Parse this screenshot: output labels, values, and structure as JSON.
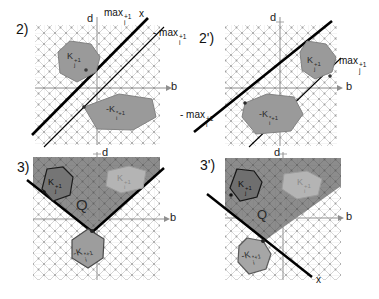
{
  "figure": {
    "description_labels": {
      "q": "Q",
      "x": "x"
    },
    "colors": {
      "background": "#ffffff",
      "hatch_line": "#c4c4c4",
      "hatch_dot": "#9e9e9e",
      "axis_gray": "#8f8f8f",
      "tangent_line_black": "#000000",
      "cone_region_gray": "#8c8c8c",
      "polygon_gray": "#9a9a9a",
      "polygon_dark_gray": "#757575",
      "polygon_light_gray": "#b4b4b4"
    },
    "panels": {
      "p2": {
        "number": "2)",
        "axis_d": "d",
        "axis_b": "b",
        "x_label": "x",
        "max_line": {
          "pre": "max",
          "sup": "+1",
          "sub": "i"
        },
        "neg_max_line": {
          "pre": "- max",
          "sup": "+1",
          "sub": "i"
        },
        "poly_upper": {
          "base": "K",
          "sup": "+1",
          "sub": "j"
        },
        "poly_lower": {
          "base": "-K",
          "sup": "*+1",
          "sub": "i"
        }
      },
      "p2p": {
        "number": "2')",
        "axis_d": "d",
        "axis_b": "b",
        "max_line": {
          "pre": "max",
          "sup": "+1",
          "sub": "j"
        },
        "neg_max_line": {
          "pre": "- max",
          "sup": "+1",
          "sub": "i"
        },
        "poly_upper": {
          "base": "K",
          "sup": "+1",
          "sub": "j"
        },
        "poly_lower": {
          "base": "-K",
          "sup": "*+1",
          "sub": "i"
        }
      },
      "p3": {
        "number": "3)",
        "axis_d": "d",
        "axis_b": "b",
        "q_label": "Q",
        "poly_left": {
          "base": "K",
          "sup": "+1",
          "sub": "j"
        },
        "poly_right": {
          "base": "K",
          "sup": "+1",
          "sub": "i"
        },
        "poly_bottom": {
          "base": "-K",
          "sup": "*+1",
          "sub": "i"
        }
      },
      "p3p": {
        "number": "3')",
        "axis_d": "d",
        "axis_b": "b",
        "q_label": "Q",
        "x_label": "x",
        "poly_left": {
          "base": "K",
          "sup": "+1",
          "sub": "j"
        },
        "poly_right": {
          "base": "K",
          "sup": "+1",
          "sub": "i"
        },
        "poly_bottom": {
          "base": "-K",
          "sup": "*+1",
          "sub": "i"
        }
      }
    }
  }
}
